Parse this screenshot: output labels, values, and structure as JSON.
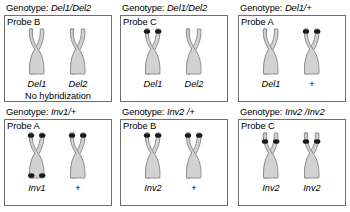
{
  "figure": {
    "colors": {
      "chromatid_fill": "#d2d2d2",
      "chromatid_stroke": "#8f8f8f",
      "signal_dot": "#1a1a1a",
      "panel_border": "#6e6e6e",
      "background": "#ffffff",
      "text": "#000000"
    },
    "genotype_prefix": "Genotype:"
  },
  "panels": [
    {
      "id": "panel-1",
      "genotype": "Del1/Del2",
      "probe": "Probe B",
      "note": "No hybridization",
      "chromosomes": [
        {
          "label": "Del1",
          "label_italic": true,
          "dots_top": false,
          "dots_bottom": false,
          "dot_position": "none"
        },
        {
          "label": "Del2",
          "label_italic": true,
          "dots_top": false,
          "dots_bottom": false,
          "dot_position": "none"
        }
      ]
    },
    {
      "id": "panel-2",
      "genotype": "Del1/Del2",
      "probe": "Probe C",
      "note": "",
      "chromosomes": [
        {
          "label": "Del1",
          "label_italic": true,
          "dots_top": true,
          "dots_bottom": false,
          "dot_position": "tip"
        },
        {
          "label": "Del2",
          "label_italic": true,
          "dots_top": false,
          "dots_bottom": false,
          "dot_position": "none"
        }
      ]
    },
    {
      "id": "panel-3",
      "genotype": "Del1/+",
      "probe": "Probe A",
      "note": "",
      "chromosomes": [
        {
          "label": "Del1",
          "label_italic": true,
          "dots_top": false,
          "dots_bottom": false,
          "dot_position": "none"
        },
        {
          "label": "+",
          "label_italic": false,
          "dots_top": true,
          "dots_bottom": false,
          "dot_position": "tip"
        }
      ]
    },
    {
      "id": "panel-4",
      "genotype": "Inv1/+",
      "probe": "Probe A",
      "note": "",
      "chromosomes": [
        {
          "label": "Inv1",
          "label_italic": true,
          "dots_top": true,
          "dots_bottom": true,
          "dot_position": "tip"
        },
        {
          "label": "+",
          "label_italic": false,
          "dots_top": true,
          "dots_bottom": false,
          "dot_position": "tip"
        }
      ]
    },
    {
      "id": "panel-5",
      "genotype": "Inv2 /+",
      "probe": "Probe B",
      "note": "",
      "chromosomes": [
        {
          "label": "Inv2",
          "label_italic": true,
          "dots_top": true,
          "dots_bottom": false,
          "dot_position": "tip"
        },
        {
          "label": "+",
          "label_italic": false,
          "dots_top": true,
          "dots_bottom": false,
          "dot_position": "tip"
        }
      ]
    },
    {
      "id": "panel-6",
      "genotype": "Inv2 /Inv2",
      "probe": "Probe C",
      "note": "",
      "chromosomes": [
        {
          "label": "Inv2",
          "label_italic": true,
          "dots_top": true,
          "dots_bottom": false,
          "dot_position": "mid"
        },
        {
          "label": "Inv2",
          "label_italic": true,
          "dots_top": true,
          "dots_bottom": false,
          "dot_position": "mid"
        }
      ]
    }
  ]
}
